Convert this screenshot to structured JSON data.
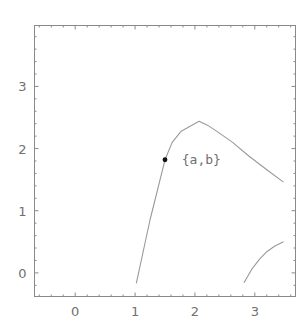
{
  "chart_data": {
    "type": "line",
    "title": "",
    "xlabel": "",
    "ylabel": "",
    "xlim": [
      -0.68,
      3.68
    ],
    "ylim": [
      -0.38,
      3.98
    ],
    "grid": false,
    "legend": null,
    "x_ticks": [
      0,
      1,
      2,
      3
    ],
    "y_ticks": [
      0,
      1,
      2,
      3
    ],
    "x_tick_labels": [
      "0",
      "1",
      "2",
      "3"
    ],
    "y_tick_labels": [
      "0",
      "1",
      "2",
      "3"
    ],
    "series": [
      {
        "name": "curve-1",
        "x": [
          1.02,
          1.25,
          1.5,
          1.62,
          1.77,
          1.92,
          2.07,
          2.2,
          2.33,
          2.48,
          2.63,
          2.9,
          3.2,
          3.48
        ],
        "y": [
          -0.17,
          0.85,
          1.82,
          2.1,
          2.28,
          2.36,
          2.44,
          2.38,
          2.3,
          2.2,
          2.1,
          1.88,
          1.66,
          1.46
        ]
      },
      {
        "name": "curve-2",
        "x": [
          2.82,
          2.95,
          3.08,
          3.2,
          3.33,
          3.48
        ],
        "y": [
          -0.16,
          0.06,
          0.22,
          0.34,
          0.43,
          0.5
        ]
      }
    ],
    "points": [
      {
        "x": 1.5,
        "y": 1.82,
        "label": "{a,b}"
      }
    ],
    "annotations": [
      {
        "text": "{a,b}",
        "x": 1.78,
        "y": 1.82
      }
    ],
    "colors": {
      "frame": "#8a8a8a",
      "curve": "#9a9a9a",
      "point": "#111111",
      "text": "#707070"
    }
  }
}
